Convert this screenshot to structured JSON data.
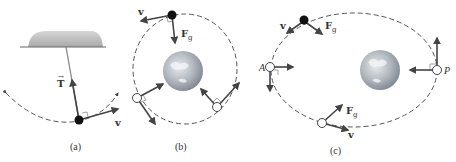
{
  "figure": {
    "panels": [
      {
        "id": "a",
        "caption": "(a)",
        "description": "pendulum swinging along dashed circular arc",
        "labels": {
          "tension": "T",
          "velocity": "v"
        }
      },
      {
        "id": "b",
        "caption": "(b)",
        "description": "satellite in circular orbit around Earth",
        "labels": {
          "velocity": "v",
          "force_main": "F",
          "force_sub": "g"
        }
      },
      {
        "id": "c",
        "caption": "(c)",
        "description": "satellite in elliptical orbit around Earth",
        "labels": {
          "velocity_top": "v",
          "force_top_main": "F",
          "force_top_sub": "g",
          "aphelion": "A",
          "perihelion": "P",
          "force_bottom_main": "F",
          "force_bottom_sub": "g",
          "velocity_bottom": "v"
        }
      }
    ],
    "colors": {
      "ink": "#444444",
      "ceiling": "#b8b8b8",
      "earth_light": "#d9dde2",
      "earth_dark": "#8a929c"
    }
  }
}
